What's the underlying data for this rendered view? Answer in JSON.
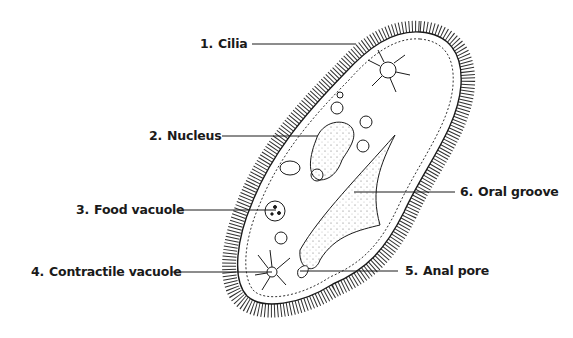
{
  "diagram": {
    "labels": [
      {
        "num": "1.",
        "text": "Cilia"
      },
      {
        "num": "2.",
        "text": "Nucleus"
      },
      {
        "num": "3.",
        "text": "Food vacuole"
      },
      {
        "num": "4.",
        "text": "Contractile vacuole"
      },
      {
        "num": "5.",
        "text": "Anal pore"
      },
      {
        "num": "6.",
        "text": "Oral groove"
      }
    ],
    "colors": {
      "ink": "#1a1a1a",
      "background": "#ffffff"
    }
  }
}
